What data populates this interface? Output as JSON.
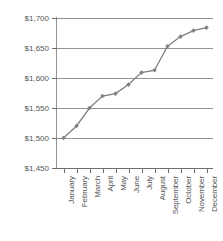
{
  "chart_data": {
    "type": "line",
    "title": "",
    "subtitle": "",
    "xlabel": "",
    "ylabel": "",
    "categories": [
      "January",
      "February",
      "March",
      "April",
      "May",
      "June",
      "July",
      "August",
      "September",
      "October",
      "November",
      "December"
    ],
    "values": [
      1500,
      1520,
      1550,
      1570,
      1574,
      1589,
      1609,
      1613,
      1653,
      1669,
      1679,
      1684
    ],
    "series": [
      {
        "name": "",
        "values": [
          1500,
          1520,
          1550,
          1570,
          1574,
          1589,
          1609,
          1613,
          1653,
          1669,
          1679,
          1684
        ]
      }
    ],
    "ylim": [
      1450,
      1700
    ],
    "ytick_values": [
      1450,
      1500,
      1550,
      1600,
      1650,
      1700
    ],
    "ytick_labels": [
      "$1,450",
      "$1,500",
      "$1,550",
      "$1,600",
      "$1,650",
      "$1,700"
    ],
    "grid": "horizontal",
    "legend": "none",
    "marker": "diamond",
    "line_color": "#808080",
    "marker_color": "#808080",
    "grid_color": "#949494",
    "axis_color": "#6e6e6e",
    "text_color": "#555555",
    "background": "#ffffff"
  }
}
